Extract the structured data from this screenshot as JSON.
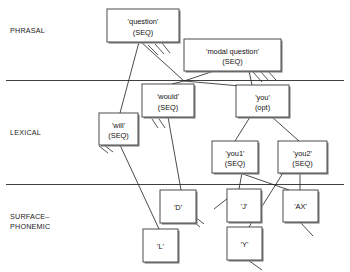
{
  "diagram": {
    "width": 350,
    "height": 272,
    "background_color": "#ffffff",
    "line_color": "#2b2b2b",
    "box_fill": "#ffffff",
    "box_stroke": "#3a3a3a",
    "strata": [
      {
        "id": "phrasal",
        "label": "PHRASAL",
        "x": 10,
        "y": 33,
        "divider_y": 80.5
      },
      {
        "id": "lexical",
        "label": "LEXICAL",
        "x": 10,
        "y": 135,
        "divider_y": 184.5
      },
      {
        "id": "surface-phonemic",
        "label": "SURFACE–",
        "label2": "PHONEMIC",
        "x": 10,
        "y": 219,
        "y2": 229
      }
    ],
    "dividers": [
      {
        "id": "phrasal-lexical-divider",
        "x1": 6,
        "y1": 80.5,
        "x2": 344,
        "y2": 80.5
      },
      {
        "id": "lexical-surface-divider",
        "x1": 6,
        "y1": 184.5,
        "x2": 344,
        "y2": 184.5
      }
    ],
    "nodes": [
      {
        "id": "question",
        "line1": "'question'",
        "line2": "(SEQ)",
        "x": 107,
        "y": 9,
        "w": 72,
        "h": 33,
        "stratum": "phrasal"
      },
      {
        "id": "modal-question",
        "line1": "'modal question'",
        "line2": "(SEQ)",
        "x": 184,
        "y": 39,
        "w": 97,
        "h": 32,
        "stratum": "phrasal"
      },
      {
        "id": "would",
        "line1": "'would'",
        "line2": "(SEQ)",
        "x": 142,
        "y": 84,
        "w": 52,
        "h": 33,
        "stratum": "lexical"
      },
      {
        "id": "you",
        "line1": "'you'",
        "line2": "(opt)",
        "x": 236,
        "y": 85,
        "w": 53,
        "h": 32,
        "stratum": "lexical"
      },
      {
        "id": "will",
        "line1": "'will'",
        "line2": "(SEQ)",
        "x": 99,
        "y": 113,
        "w": 39,
        "h": 32,
        "stratum": "lexical"
      },
      {
        "id": "you1",
        "line1": "'you1'",
        "line2": "(SEQ)",
        "x": 212,
        "y": 141,
        "w": 46,
        "h": 32,
        "stratum": "lexical"
      },
      {
        "id": "you2",
        "line1": "'you2'",
        "line2": "(SEQ)",
        "x": 278,
        "y": 141,
        "w": 49,
        "h": 32,
        "stratum": "lexical"
      },
      {
        "id": "d",
        "line1": "'D'",
        "line2": "",
        "x": 160,
        "y": 190,
        "w": 36,
        "h": 33,
        "stratum": "surface-phonemic"
      },
      {
        "id": "j",
        "line1": "'J'",
        "line2": "",
        "x": 227,
        "y": 189,
        "w": 34,
        "h": 33,
        "stratum": "surface-phonemic"
      },
      {
        "id": "ax",
        "line1": "'AX'",
        "line2": "",
        "x": 283,
        "y": 190,
        "w": 35,
        "h": 32,
        "stratum": "surface-phonemic"
      },
      {
        "id": "l",
        "line1": "'L'",
        "line2": "",
        "x": 143,
        "y": 229,
        "w": 35,
        "h": 33,
        "stratum": "surface-phonemic"
      },
      {
        "id": "y",
        "line1": "'Y'",
        "line2": "",
        "x": 227,
        "y": 227,
        "w": 35,
        "h": 33,
        "stratum": "surface-phonemic"
      }
    ],
    "edges": [
      {
        "id": "question-to-will",
        "from": "question",
        "to": "will",
        "points": "139,42 120,113"
      },
      {
        "id": "question-to-junction",
        "from": "question",
        "to": "junction",
        "points": "141,42 184,81"
      },
      {
        "id": "modal-question-to-junction",
        "from": "modal-question",
        "to": "junction",
        "points": "214,71 184,81"
      },
      {
        "id": "junction-to-would",
        "from": "junction",
        "to": "would",
        "points": "184,81 172,84"
      },
      {
        "id": "junction-to-you",
        "from": "junction",
        "to": "you",
        "points": "184,81 240,86"
      },
      {
        "id": "modal-question-to-you",
        "from": "modal-question",
        "to": "you",
        "points": "249,71 252,85"
      },
      {
        "id": "would-to-d",
        "from": "would",
        "to": "d",
        "points": "168,117 181,190"
      },
      {
        "id": "will-to-l",
        "from": "will",
        "to": "l",
        "points": "120,145 159,229"
      },
      {
        "id": "you-to-you1",
        "from": "you",
        "to": "you1",
        "points": "250,117 235,141"
      },
      {
        "id": "you-to-you2",
        "from": "you",
        "to": "you2",
        "points": "272,117 299,141"
      },
      {
        "id": "you1-to-j",
        "from": "you1",
        "to": "j",
        "points": "242,173 239,189"
      },
      {
        "id": "you1-to-ax",
        "from": "you1",
        "to": "ax",
        "points": "240,173 289,190"
      },
      {
        "id": "you2-to-y",
        "from": "you2",
        "to": "y",
        "points": "283,173 249,227"
      },
      {
        "id": "you2-to-ax",
        "from": "you2",
        "to": "ax",
        "points": "300,173 300,190"
      }
    ],
    "tails": [
      {
        "id": "tail-j",
        "points": "228,198 214,209"
      },
      {
        "id": "tail-y",
        "points": "248,260 262,270"
      },
      {
        "id": "tail-ax",
        "points": "300,222 313,236"
      }
    ],
    "hatch_groups": [
      {
        "id": "hatch-question",
        "near": "question",
        "marks": [
          "148,45 158,55",
          "155,44 164,54",
          "162,43 170,53"
        ]
      },
      {
        "id": "hatch-modal-question",
        "near": "modal-question",
        "marks": [
          "253,72 262,82",
          "260,71 269,81",
          "267,70 276,80"
        ]
      },
      {
        "id": "hatch-would",
        "near": "would",
        "marks": [
          "152,119 158,128",
          "159,119 165,128"
        ]
      },
      {
        "id": "hatch-will",
        "near": "will",
        "marks": [
          "99,146 108,153",
          "104,145 113,152"
        ]
      },
      {
        "id": "hatch-d",
        "near": "d",
        "marks": [
          "190,219 200,227",
          "194,216 204,224"
        ]
      }
    ]
  }
}
